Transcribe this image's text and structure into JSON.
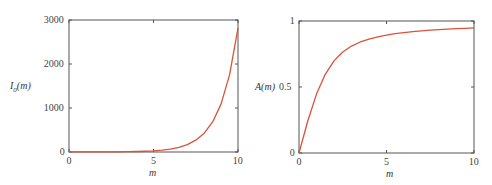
{
  "chart_data": [
    {
      "type": "line",
      "title": "",
      "xlabel": "m",
      "ylabel": "I0(m)",
      "ylabel_display": "I",
      "ylabel_sub": "0",
      "ylabel_suffix": "(m)",
      "xlim": [
        0,
        10
      ],
      "ylim": [
        0,
        3000
      ],
      "xticks": [
        "0",
        "5",
        "10"
      ],
      "yticks": [
        "0",
        "1000",
        "2000",
        "3000"
      ],
      "grid": false,
      "legend": null,
      "series": [
        {
          "name": "I0(m)",
          "color": "#d9533a",
          "x": [
            0,
            0.5,
            1,
            1.5,
            2,
            2.5,
            3,
            3.5,
            4,
            4.5,
            5,
            5.5,
            6,
            6.5,
            7,
            7.5,
            8,
            8.5,
            9,
            9.5,
            10
          ],
          "y": [
            1,
            1.06,
            1.27,
            1.65,
            2.28,
            3.29,
            4.88,
            7.38,
            11.3,
            17.48,
            27.24,
            42.69,
            67.23,
            106.3,
            168.6,
            268.2,
            427.6,
            683.2,
            1093.6,
            1753.0,
            2815.7
          ]
        }
      ]
    },
    {
      "type": "line",
      "title": "",
      "xlabel": "m",
      "ylabel": "A(m)",
      "xlim": [
        0,
        10
      ],
      "ylim": [
        0,
        1
      ],
      "xticks": [
        "0",
        "5",
        "10"
      ],
      "yticks": [
        "0",
        "0.5",
        "1"
      ],
      "grid": false,
      "legend": null,
      "series": [
        {
          "name": "A(m)",
          "color": "#d9533a",
          "x": [
            0,
            0.5,
            1,
            1.5,
            2,
            2.5,
            3,
            3.5,
            4,
            4.5,
            5,
            5.5,
            6,
            6.5,
            7,
            7.5,
            8,
            8.5,
            9,
            9.5,
            10
          ],
          "y": [
            0,
            0.2425,
            0.4464,
            0.5961,
            0.6978,
            0.7652,
            0.81,
            0.8411,
            0.8635,
            0.8803,
            0.8934,
            0.9038,
            0.9123,
            0.9193,
            0.9252,
            0.9302,
            0.9345,
            0.9383,
            0.9416,
            0.9446,
            0.9473
          ]
        }
      ]
    }
  ]
}
